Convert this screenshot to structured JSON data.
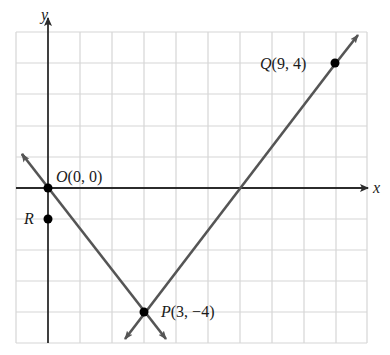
{
  "diagram": {
    "type": "coordinate-plane",
    "grid": {
      "x_min": -1,
      "x_max": 10,
      "y_min": -5,
      "y_max": 5,
      "step": 1
    },
    "axes": {
      "x_label": "x",
      "y_label": "y"
    },
    "points": [
      {
        "id": "O",
        "name": "O",
        "coords": "(0, 0)",
        "x": 0,
        "y": 0
      },
      {
        "id": "R",
        "name": "R",
        "coords": "",
        "x": 0,
        "y": -1
      },
      {
        "id": "P",
        "name": "P",
        "coords": "(3, −4)",
        "x": 3,
        "y": -4
      },
      {
        "id": "Q",
        "name": "Q",
        "coords": "(9, 4)",
        "x": 9,
        "y": 4
      }
    ],
    "lines": [
      {
        "id": "OP",
        "through": [
          "O",
          "P"
        ]
      },
      {
        "id": "PQ",
        "through": [
          "P",
          "Q"
        ]
      }
    ],
    "colors": {
      "grid": "#d6d6d6",
      "axis": "#2b2b2b",
      "line": "#555555",
      "point": "#000000"
    }
  }
}
